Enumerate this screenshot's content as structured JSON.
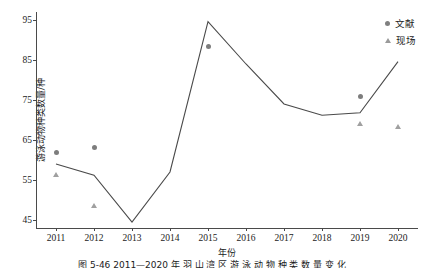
{
  "chart_data": {
    "type": "line",
    "title": "",
    "xlabel": "年份",
    "ylabel": "游泳动物种类数量/种",
    "categories": [
      "2011",
      "2012",
      "2013",
      "2014",
      "2015",
      "2016",
      "2017",
      "2018",
      "2019",
      "2020"
    ],
    "xlim": [
      2010.5,
      2020.5
    ],
    "ylim": [
      43,
      97
    ],
    "yticks": [
      45,
      55,
      65,
      75,
      85,
      95
    ],
    "grid": false,
    "legend_position": "top-right",
    "series": [
      {
        "name": "趋势线",
        "marker": "none",
        "type": "line",
        "color": "#4a4a4a",
        "values": [
          59.0,
          56.2,
          44.5,
          57.0,
          94.6,
          84.0,
          74.0,
          71.2,
          71.8,
          84.6
        ]
      },
      {
        "name": "文献",
        "marker": "circle",
        "type": "scatter",
        "color": "#7d7d7d",
        "values": [
          61.8,
          63.2,
          null,
          null,
          88.3,
          null,
          null,
          null,
          75.8,
          null
        ]
      },
      {
        "name": "现场",
        "marker": "triangle",
        "type": "scatter",
        "color": "#a0a0a0",
        "values": [
          56.3,
          48.5,
          null,
          null,
          null,
          null,
          null,
          null,
          69.0,
          68.3
        ]
      }
    ]
  },
  "legend": {
    "entries": [
      {
        "label": "文献",
        "marker": "circle-marker-icon"
      },
      {
        "label": "现场",
        "marker": "triangle-marker-icon"
      }
    ]
  },
  "caption": {
    "text": "图 5-46   2011—2020 年 羽 山 湾 区 游 泳 动 物 种 类 数 量 变 化"
  }
}
